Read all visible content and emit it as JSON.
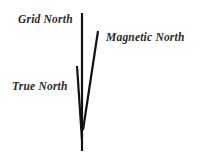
{
  "diagram": {
    "labels": {
      "grid_north": "Grid North",
      "magnetic_north": "Magnetic North",
      "true_north": "True North"
    },
    "line_color": "#111111",
    "text_color": "#2a2a2a"
  }
}
